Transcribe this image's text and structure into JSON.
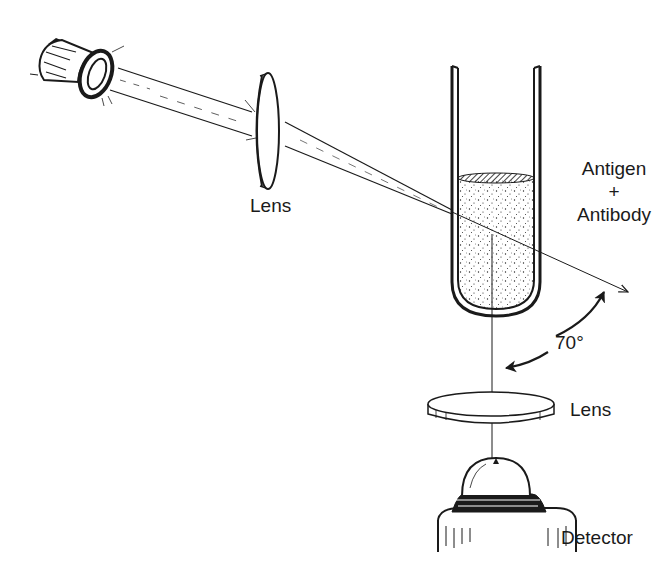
{
  "diagram": {
    "type": "optical setup illustration",
    "components": [
      {
        "id": "light-source",
        "label": ""
      },
      {
        "id": "lens-1",
        "label": "Lens"
      },
      {
        "id": "sample-tube",
        "label": "Antigen + Antibody"
      },
      {
        "id": "lens-2",
        "label": "Lens"
      },
      {
        "id": "detector",
        "label": "Detector"
      }
    ],
    "angle": "70°"
  },
  "labels": {
    "lens_top": "Lens",
    "antigen": "Antigen",
    "plus": "+",
    "antibody": "Antibody",
    "angle": "70°",
    "lens_bottom": "Lens",
    "detector": "Detector"
  },
  "colors": {
    "ink": "#1a1a1a",
    "background": "#ffffff"
  }
}
